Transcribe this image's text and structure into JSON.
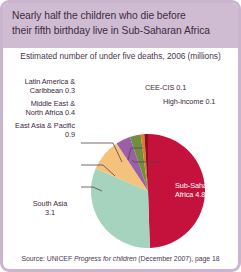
{
  "card": {
    "border_color": "#c9b5cd",
    "title_bg": "#cfbcd3",
    "background": "#ffffff"
  },
  "title": {
    "line1": "Nearly half the children who die before",
    "line2": "their fifth birthday live in Sub-Saharan Africa"
  },
  "subtitle": "Estimated number of under five deaths, 2006 (millions)",
  "source": {
    "prefix": "Source: UNICEF ",
    "italic": "Progress for children",
    "suffix": " (December 2007), page 18"
  },
  "labels": {
    "latin_america": "Latin America &",
    "latin_america2": "Caribbean 0.3",
    "middle_east": "Middle East &",
    "middle_east2": "North Africa 0.4",
    "east_asia": "East Asia & Pacific",
    "east_asia2": "0.9",
    "south_asia": "South Asia",
    "south_asia2": "3.1",
    "cee_cis": "CEE-CIS 0.1",
    "high_income": "High-income 0.1",
    "sub_saharan": "Sub-Saharan",
    "sub_saharan2": "Africa 4.8"
  },
  "chart_data": {
    "type": "pie",
    "title": "Nearly half the children who die before their fifth birthday live in Sub-Saharan Africa",
    "subtitle": "Estimated number of under five deaths, 2006 (millions)",
    "unit": "millions",
    "total": 9.7,
    "legend_position": "callout-labels",
    "categories": [
      "Sub-Saharan Africa",
      "South Asia",
      "East Asia & Pacific",
      "Middle East & North Africa",
      "Latin America & Caribbean",
      "CEE-CIS",
      "High-income"
    ],
    "values": [
      4.8,
      3.1,
      0.9,
      0.4,
      0.3,
      0.1,
      0.1
    ],
    "colors": [
      "#c4123c",
      "#a6d3bd",
      "#f4c27a",
      "#9b5fa8",
      "#6f8f3e",
      "#e07a28",
      "#8c1020"
    ],
    "slices": [
      {
        "label": "Sub-Saharan Africa",
        "value": 4.8,
        "color": "#c4123c"
      },
      {
        "label": "South Asia",
        "value": 3.1,
        "color": "#a6d3bd"
      },
      {
        "label": "East Asia & Pacific",
        "value": 0.9,
        "color": "#f4c27a"
      },
      {
        "label": "Middle East & North Africa",
        "value": 0.4,
        "color": "#9b5fa8"
      },
      {
        "label": "Latin America & Caribbean",
        "value": 0.3,
        "color": "#6f8f3e"
      },
      {
        "label": "CEE-CIS",
        "value": 0.1,
        "color": "#e07a28"
      },
      {
        "label": "High-income",
        "value": 0.1,
        "color": "#8c1020"
      }
    ]
  }
}
